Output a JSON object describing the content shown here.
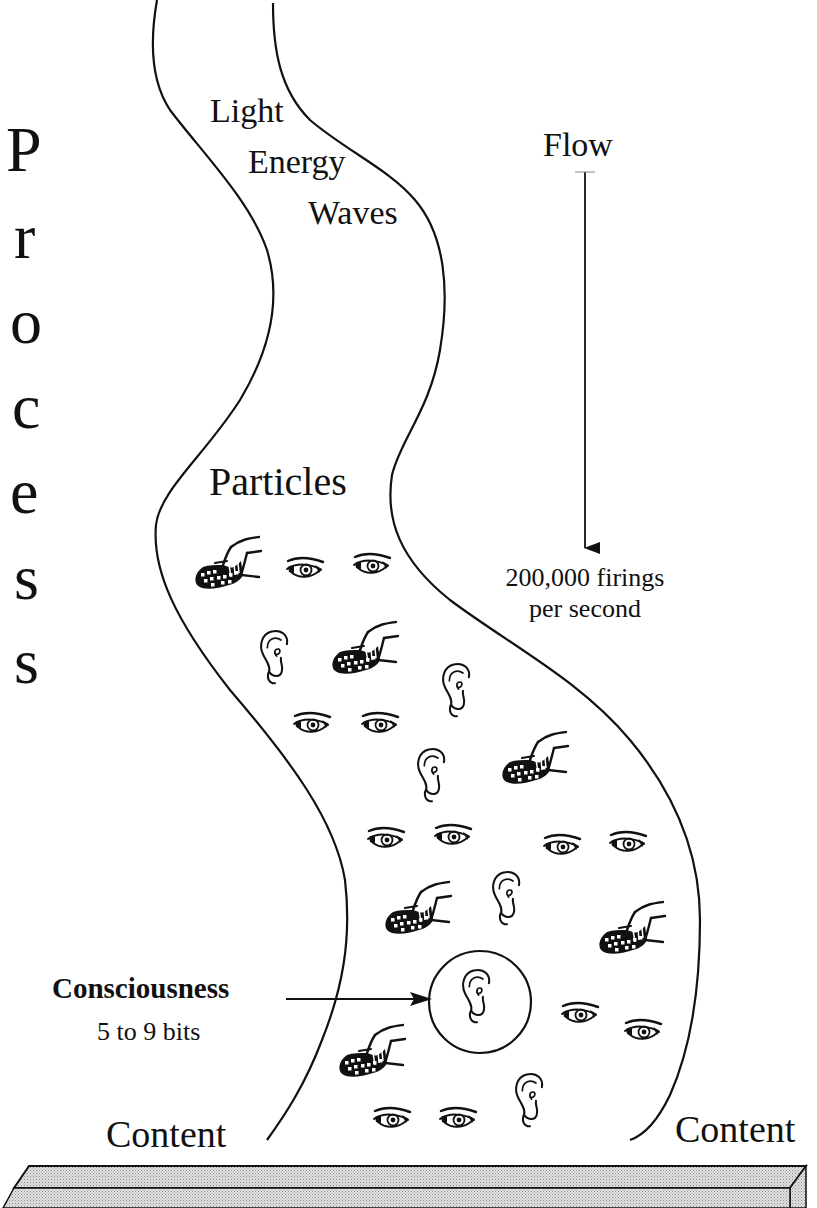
{
  "side_title": {
    "text": "Process",
    "letters": [
      "P",
      "r",
      "o",
      "c",
      "e",
      "s",
      "s"
    ]
  },
  "stream": {
    "top_label": [
      "Light",
      "Energy",
      "Waves"
    ],
    "middle_label": "Particles",
    "bottom_left_label": "Content",
    "bottom_right_label": "Content"
  },
  "flow": {
    "label": "Flow",
    "rate_line1": "200,000 firings",
    "rate_line2": "per second"
  },
  "consciousness": {
    "label": "Consciousness",
    "capacity": "5 to 9 bits",
    "highlighted_particle": "ear-icon"
  },
  "particles": {
    "types": [
      "hand-icon",
      "eye-icon",
      "ear-icon"
    ],
    "items": [
      {
        "type": "hand",
        "x": 193,
        "y": 535
      },
      {
        "type": "eye",
        "x": 285,
        "y": 555
      },
      {
        "type": "eye",
        "x": 352,
        "y": 551
      },
      {
        "type": "ear",
        "x": 258,
        "y": 627
      },
      {
        "type": "hand",
        "x": 330,
        "y": 620
      },
      {
        "type": "ear",
        "x": 440,
        "y": 660
      },
      {
        "type": "eye",
        "x": 292,
        "y": 710
      },
      {
        "type": "eye",
        "x": 360,
        "y": 710
      },
      {
        "type": "ear",
        "x": 415,
        "y": 745
      },
      {
        "type": "hand",
        "x": 500,
        "y": 730
      },
      {
        "type": "eye",
        "x": 366,
        "y": 825
      },
      {
        "type": "eye",
        "x": 433,
        "y": 822
      },
      {
        "type": "eye",
        "x": 542,
        "y": 832
      },
      {
        "type": "eye",
        "x": 608,
        "y": 829
      },
      {
        "type": "hand",
        "x": 383,
        "y": 880
      },
      {
        "type": "ear",
        "x": 490,
        "y": 868
      },
      {
        "type": "hand",
        "x": 597,
        "y": 900
      },
      {
        "type": "eye",
        "x": 560,
        "y": 1000
      },
      {
        "type": "eye",
        "x": 623,
        "y": 1017
      },
      {
        "type": "hand",
        "x": 337,
        "y": 1023
      },
      {
        "type": "ear",
        "x": 513,
        "y": 1070
      },
      {
        "type": "eye",
        "x": 372,
        "y": 1105
      },
      {
        "type": "eye",
        "x": 438,
        "y": 1105
      }
    ]
  },
  "colors": {
    "ink": "#111111",
    "background": "#ffffff",
    "bar_fill": "#c8c8c8"
  }
}
